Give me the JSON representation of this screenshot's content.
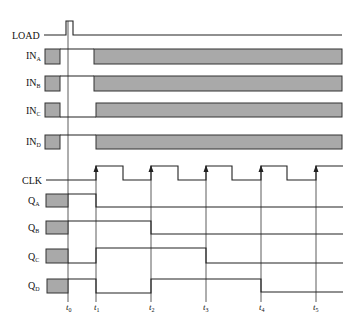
{
  "diagram": {
    "type": "timing-diagram",
    "colors": {
      "line": "#222222",
      "shade": "#a9a9a9",
      "background": "#ffffff"
    },
    "signals": [
      {
        "id": "load",
        "label": "LOAD",
        "sub": ""
      },
      {
        "id": "in_a",
        "label": "IN",
        "sub": "A"
      },
      {
        "id": "in_b",
        "label": "IN",
        "sub": "B"
      },
      {
        "id": "in_c",
        "label": "IN",
        "sub": "C"
      },
      {
        "id": "in_d",
        "label": "IN",
        "sub": "D"
      },
      {
        "id": "clk",
        "label": "CLK",
        "sub": ""
      },
      {
        "id": "q_a",
        "label": "Q",
        "sub": "A"
      },
      {
        "id": "q_b",
        "label": "Q",
        "sub": "B"
      },
      {
        "id": "q_c",
        "label": "Q",
        "sub": "C"
      },
      {
        "id": "q_d",
        "label": "Q",
        "sub": "D"
      }
    ],
    "time_markers": [
      {
        "label": "t",
        "sub": "0"
      },
      {
        "label": "t",
        "sub": "1"
      },
      {
        "label": "t",
        "sub": "2"
      },
      {
        "label": "t",
        "sub": "3"
      },
      {
        "label": "t",
        "sub": "4"
      },
      {
        "label": "t",
        "sub": "5"
      }
    ],
    "waveforms": {
      "load": "single pulse high at t0, low otherwise",
      "in_a": "data valid before t0, undefined until t1, data region after t1",
      "in_b": "data valid before t0, undefined until t1, data region after t1",
      "in_c": "data valid before t0, undefined until t1, data region after t1",
      "in_d": "data valid before t0, undefined until t1, data region after t1",
      "clk": "rising edges at t1, t2, t3, t4, t5",
      "q_a": [
        1,
        0,
        0,
        0,
        0
      ],
      "q_b": [
        1,
        1,
        0,
        0,
        0
      ],
      "q_c": [
        0,
        1,
        1,
        0,
        0
      ],
      "q_d": [
        1,
        0,
        1,
        1,
        0
      ]
    }
  }
}
